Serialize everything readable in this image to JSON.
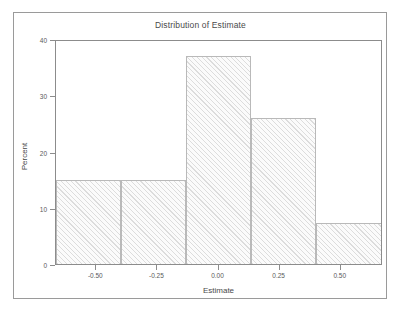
{
  "chart_data": {
    "type": "bar",
    "title": "Distribution of Estimate",
    "xlabel": "Estimate",
    "ylabel": "Percent",
    "grid": false,
    "legend": null,
    "xlim": [
      -0.665,
      0.673
    ],
    "ylim": [
      0,
      40
    ],
    "xticks": [
      -0.5,
      -0.25,
      0.0,
      0.25,
      0.5
    ],
    "xtick_labels": [
      "-0.50",
      "-0.25",
      "0.00",
      "0.25",
      "0.50"
    ],
    "yticks": [
      0,
      10,
      20,
      30,
      40
    ],
    "ytick_labels": [
      "0",
      "10",
      "20",
      "30",
      "40"
    ],
    "bin_edges": [
      -0.665,
      -0.399,
      -0.133,
      0.133,
      0.399,
      0.673
    ],
    "bin_centers": [
      -0.532,
      -0.266,
      0.0,
      0.266,
      0.536
    ],
    "categories": [
      "-0.53",
      "-0.27",
      "0.00",
      "0.27",
      "0.54"
    ],
    "values": [
      15,
      15,
      37,
      26,
      7.3
    ],
    "bars": [
      {
        "left": -0.665,
        "right": -0.399,
        "value": 15
      },
      {
        "left": -0.399,
        "right": -0.133,
        "value": 15
      },
      {
        "left": -0.133,
        "right": 0.133,
        "value": 37
      },
      {
        "left": 0.133,
        "right": 0.399,
        "value": 26
      },
      {
        "left": 0.399,
        "right": 0.673,
        "value": 7.3
      }
    ],
    "colors": {
      "bar_fill": "#fbfbfb",
      "bar_hatch": "#969696",
      "bar_edge": "#b9b9b9",
      "axis": "#8c8c8c",
      "frame": "#9a9a9a",
      "text": "#4a4a4a",
      "background": "#ffffff"
    }
  }
}
